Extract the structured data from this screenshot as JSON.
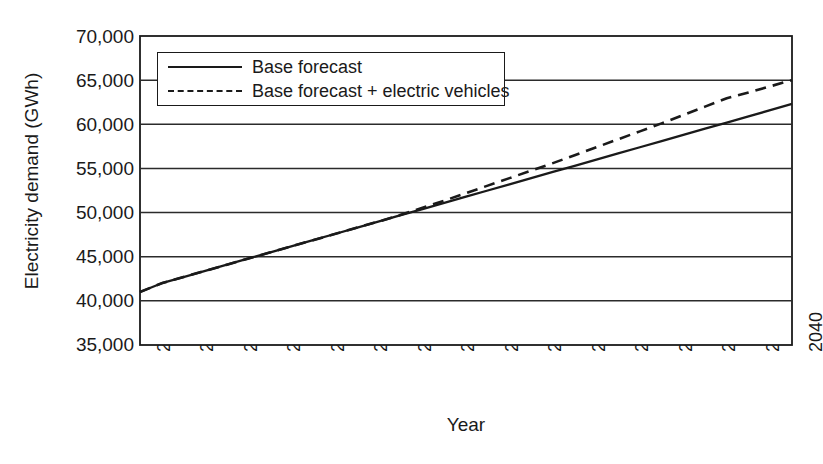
{
  "chart_data": {
    "type": "line",
    "title": "",
    "xlabel": "Year",
    "ylabel": "Electricity demand (GWh)",
    "xlim": [
      2010,
      2040
    ],
    "ylim": [
      35000,
      70000
    ],
    "ytick_step": 5000,
    "xtick_step": 2,
    "grid": "horizontal",
    "legend_position": "top-left-inside",
    "x": [
      2010,
      2011,
      2012,
      2013,
      2014,
      2015,
      2016,
      2017,
      2018,
      2019,
      2020,
      2021,
      2022,
      2023,
      2024,
      2025,
      2026,
      2027,
      2028,
      2029,
      2030,
      2031,
      2032,
      2033,
      2034,
      2035,
      2036,
      2037,
      2038,
      2039,
      2040
    ],
    "xticklabels": [
      "2010",
      "2012",
      "2014",
      "2016",
      "2018",
      "2020",
      "2022",
      "2024",
      "2026",
      "2028",
      "2030",
      "2032",
      "2034",
      "2036",
      "2038",
      "2040"
    ],
    "yticklabels": [
      "70,000",
      "65,000",
      "60,000",
      "55,000",
      "50,000",
      "45,000",
      "40,000",
      "35,000"
    ],
    "yticks": [
      70000,
      65000,
      60000,
      55000,
      50000,
      45000,
      40000,
      35000
    ],
    "series": [
      {
        "name": "Base forecast",
        "style": "solid",
        "color": "#1a1a1a",
        "values": [
          41000,
          42000,
          42700,
          43400,
          44100,
          44800,
          45500,
          46200,
          46900,
          47600,
          48300,
          49000,
          49700,
          50400,
          51100,
          51800,
          52500,
          53200,
          53900,
          54600,
          55300,
          56000,
          56700,
          57400,
          58100,
          58800,
          59500,
          60200,
          60900,
          61600,
          62300
        ]
      },
      {
        "name": "Base forecast + electric vehicles",
        "style": "dashed",
        "color": "#1a1a1a",
        "values": [
          41000,
          42000,
          42700,
          43400,
          44100,
          44800,
          45500,
          46200,
          46900,
          47600,
          48300,
          49000,
          49750,
          50550,
          51350,
          52200,
          53050,
          53900,
          54750,
          55600,
          56500,
          57400,
          58300,
          59200,
          60100,
          61050,
          62000,
          62950,
          63600,
          64300,
          65000
        ]
      }
    ],
    "annotations": [
      "Both series are coincident from 2010 until about 2023, then the electric-vehicle series rises above the base forecast.",
      "Series cross the 50,000 gridline around 2022 and the 55,000 gridline around 2029-2030."
    ]
  },
  "legend": {
    "items": [
      {
        "label": "Base forecast",
        "style": "solid"
      },
      {
        "label": "Base forecast + electric vehicles",
        "style": "dashed"
      }
    ]
  },
  "axes": {
    "y_title": "Electricity demand (GWh)",
    "x_title": "Year"
  },
  "colors": {
    "ink": "#1a1a1a",
    "background": "#ffffff",
    "grid": "#2b2b2b"
  }
}
